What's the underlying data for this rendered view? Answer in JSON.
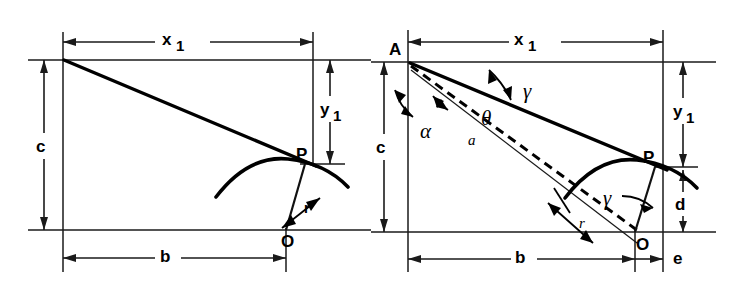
{
  "figure": {
    "background_color": "#ffffff",
    "line_color": "#000000",
    "width": 742,
    "height": 289
  },
  "left_diagram": {
    "name": "simple-geometry",
    "labels": {
      "x1_base": "x",
      "x1_sub": "1",
      "y1_base": "y",
      "y1_sub": "1",
      "c": "c",
      "b": "b",
      "r": "r",
      "point_P": "P",
      "point_O": "O"
    }
  },
  "right_diagram": {
    "name": "angle-geometry",
    "labels": {
      "x1_base": "x",
      "x1_sub": "1",
      "y1_base": "y",
      "y1_sub": "1",
      "c": "c",
      "b": "b",
      "d": "d",
      "e": "e",
      "r": "r",
      "a": "a",
      "alpha": "α",
      "theta": "θ",
      "gamma_top": "γ",
      "gamma_bottom": "γ",
      "point_A": "A",
      "point_P": "P",
      "point_O": "O"
    }
  }
}
